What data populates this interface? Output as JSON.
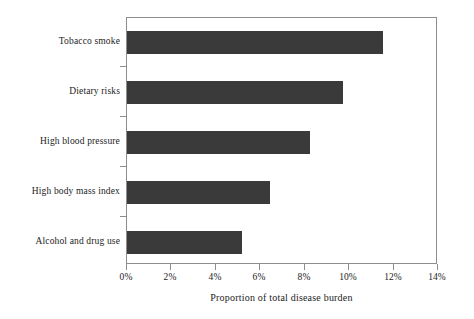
{
  "chart_data": {
    "type": "bar",
    "orientation": "horizontal",
    "title": "",
    "subtitle": "",
    "xlabel": "Proportion of total disease burden",
    "ylabel": "",
    "categories": [
      "Tobacco smoke",
      "Dietary risks",
      "High blood pressure",
      "High body mass index",
      "Alcohol and drug use"
    ],
    "values": [
      11.6,
      9.8,
      8.3,
      6.5,
      5.2
    ],
    "value_unit": "%",
    "xlim": [
      0,
      14
    ],
    "xticks": [
      0,
      2,
      4,
      6,
      8,
      10,
      12,
      14
    ],
    "xtick_labels": [
      "0%",
      "2%",
      "4%",
      "6%",
      "8%",
      "10%",
      "12%",
      "14%"
    ],
    "grid": false,
    "legend": null,
    "legend_position": "none",
    "bar_color": "#3a3a3a",
    "axis_color": "#8d8d8d",
    "text_color": "#1c1c1c",
    "background_color": "#ffffff"
  }
}
